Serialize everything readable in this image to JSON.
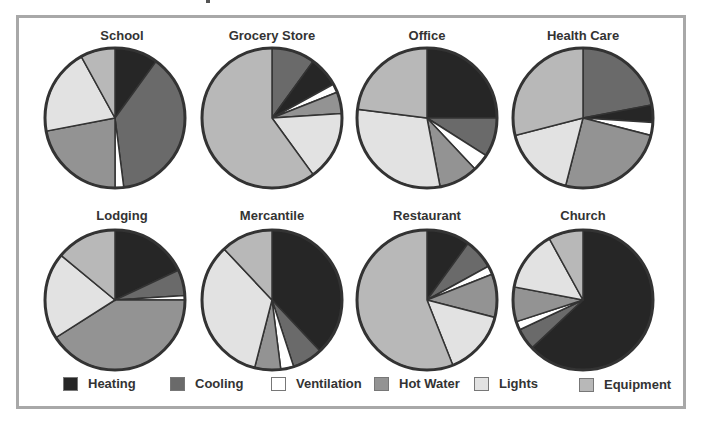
{
  "chart_data": {
    "type": "pie",
    "title": "",
    "categories": [
      "Heating",
      "Cooling",
      "Ventilation",
      "Hot Water",
      "Lights",
      "Equipment"
    ],
    "colors": {
      "Heating": "#262626",
      "Cooling": "#6a6a6a",
      "Ventilation": "#ffffff",
      "Hot Water": "#939393",
      "Lights": "#e2e2e2",
      "Equipment": "#b8b8b8"
    },
    "charts": [
      {
        "title": "School",
        "slices": [
          {
            "label": "Heating",
            "value": 10
          },
          {
            "label": "Cooling",
            "value": 38
          },
          {
            "label": "Ventilation",
            "value": 2
          },
          {
            "label": "Hot Water",
            "value": 22
          },
          {
            "label": "Lights",
            "value": 20
          },
          {
            "label": "Equipment",
            "value": 8
          }
        ]
      },
      {
        "title": "Grocery Store",
        "slices": [
          {
            "label": "Cooling",
            "value": 10
          },
          {
            "label": "Heating",
            "value": 7
          },
          {
            "label": "Ventilation",
            "value": 2
          },
          {
            "label": "Hot Water",
            "value": 5
          },
          {
            "label": "Lights",
            "value": 16
          },
          {
            "label": "Equipment",
            "value": 60
          }
        ]
      },
      {
        "title": "Office",
        "slices": [
          {
            "label": "Heating",
            "value": 25
          },
          {
            "label": "Cooling",
            "value": 9
          },
          {
            "label": "Ventilation",
            "value": 4
          },
          {
            "label": "Hot Water",
            "value": 9
          },
          {
            "label": "Lights",
            "value": 30
          },
          {
            "label": "Equipment",
            "value": 23
          }
        ]
      },
      {
        "title": "Health Care",
        "slices": [
          {
            "label": "Cooling",
            "value": 22
          },
          {
            "label": "Heating",
            "value": 4
          },
          {
            "label": "Ventilation",
            "value": 3
          },
          {
            "label": "Hot Water",
            "value": 25
          },
          {
            "label": "Lights",
            "value": 17
          },
          {
            "label": "Equipment",
            "value": 29
          }
        ]
      },
      {
        "title": "Lodging",
        "slices": [
          {
            "label": "Heating",
            "value": 18
          },
          {
            "label": "Cooling",
            "value": 6
          },
          {
            "label": "Ventilation",
            "value": 1
          },
          {
            "label": "Hot Water",
            "value": 41
          },
          {
            "label": "Lights",
            "value": 20
          },
          {
            "label": "Equipment",
            "value": 14
          }
        ]
      },
      {
        "title": "Mercantile",
        "slices": [
          {
            "label": "Heating",
            "value": 38
          },
          {
            "label": "Cooling",
            "value": 7
          },
          {
            "label": "Ventilation",
            "value": 3
          },
          {
            "label": "Hot Water",
            "value": 6
          },
          {
            "label": "Lights",
            "value": 34
          },
          {
            "label": "Equipment",
            "value": 12
          }
        ]
      },
      {
        "title": "Restaurant",
        "slices": [
          {
            "label": "Heating",
            "value": 10
          },
          {
            "label": "Cooling",
            "value": 7
          },
          {
            "label": "Ventilation",
            "value": 2
          },
          {
            "label": "Hot Water",
            "value": 10
          },
          {
            "label": "Lights",
            "value": 15
          },
          {
            "label": "Equipment",
            "value": 56
          }
        ]
      },
      {
        "title": "Church",
        "slices": [
          {
            "label": "Heating",
            "value": 63
          },
          {
            "label": "Cooling",
            "value": 5
          },
          {
            "label": "Ventilation",
            "value": 2
          },
          {
            "label": "Hot Water",
            "value": 8
          },
          {
            "label": "Lights",
            "value": 14
          },
          {
            "label": "Equipment",
            "value": 8
          }
        ]
      }
    ],
    "legend_position": "bottom"
  },
  "legend": {
    "items": [
      {
        "label": "Heating",
        "color": "#262626"
      },
      {
        "label": "Cooling",
        "color": "#6a6a6a"
      },
      {
        "label": "Ventilation",
        "color": "#ffffff"
      },
      {
        "label": "Hot Water",
        "color": "#939393"
      },
      {
        "label": "Lights",
        "color": "#e2e2e2"
      },
      {
        "label": "Equipment",
        "color": "#b8b8b8"
      }
    ]
  },
  "titles": [
    "School",
    "Grocery Store",
    "Office",
    "Health Care",
    "Lodging",
    "Mercantile",
    "Restaurant",
    "Church"
  ]
}
